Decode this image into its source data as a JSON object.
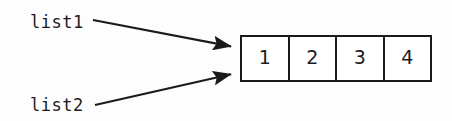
{
  "diagram": {
    "background_color": "#fdfdfd",
    "ink_color": "#1a1a1a",
    "pointers": [
      {
        "id": "list1",
        "label": "list1",
        "arrow_from": {
          "x": 93,
          "y": 20
        },
        "arrow_to": {
          "x": 239,
          "y": 48
        }
      },
      {
        "id": "list2",
        "label": "list2",
        "arrow_from": {
          "x": 95,
          "y": 105
        },
        "arrow_to": {
          "x": 239,
          "y": 72
        }
      }
    ],
    "array": {
      "name": "array-box",
      "x": 240,
      "y": 35,
      "width": 192,
      "height": 47,
      "cells": [
        {
          "value": "1"
        },
        {
          "value": "2"
        },
        {
          "value": "3"
        },
        {
          "value": "4"
        }
      ]
    }
  }
}
